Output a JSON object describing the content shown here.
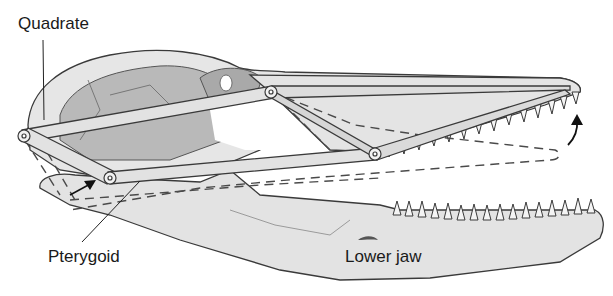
{
  "diagram": {
    "labels": {
      "quadrate": "Quadrate",
      "pterygoid": "Pterygoid",
      "lower_jaw": "Lower jaw"
    },
    "colors": {
      "bone_light": "#e6e6e6",
      "bone_mid": "#cfcfcf",
      "bone_dark": "#a9a9a9",
      "outline": "#3a3a3a",
      "bar_fill": "#e2e2e2",
      "dash": "#4a4a4a"
    }
  }
}
